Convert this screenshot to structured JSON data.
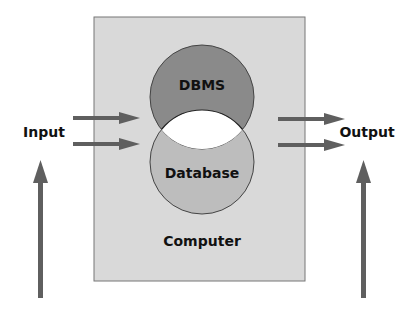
{
  "diagram": {
    "computer_label": "Computer",
    "dbms_label": "DBMS",
    "database_label": "Database",
    "input_label": "Input",
    "output_label": "Output"
  },
  "colors": {
    "computer_box": "#d9d9d9",
    "dbms_circle": "#8a8a8a",
    "database_circle": "#bdbdbd",
    "overlap": "#ffffff",
    "arrow": "#5f5f5f"
  }
}
